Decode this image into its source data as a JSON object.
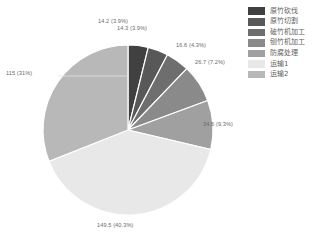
{
  "chart_data": {
    "type": "pie",
    "title": "",
    "subtitle": "",
    "xlabel": "",
    "ylabel": "",
    "legend_position": "top-right",
    "grid": false,
    "start_angle_deg": 0,
    "direction": "clockwise",
    "total": 370.9,
    "categories": [
      "原竹砍伐",
      "原竹切割",
      "破竹机加工",
      "刨竹机加工",
      "防腐处理",
      "运输1",
      "运输2"
    ],
    "values": [
      14.2,
      14.3,
      16.6,
      26.7,
      34.6,
      149.5,
      115
    ],
    "percents": [
      3.9,
      3.9,
      4.3,
      7.2,
      9.3,
      40.3,
      31
    ],
    "colors": [
      "#404040",
      "#585858",
      "#6e6e6e",
      "#8a8a8a",
      "#a0a0a0",
      "#e8e8e8",
      "#b8b8b8"
    ],
    "slice_border_color": "#ffffff",
    "data_labels": [
      "14.2 (3.9%)",
      "14.3 (3.9%)",
      "16.6 (4.3%)",
      "26.7 (7.2%)",
      "34.6 (9.3%)",
      "149.5 (40.3%)",
      "115 (31%)"
    ]
  },
  "legend": {
    "items": [
      {
        "label": "原竹砍伐",
        "color": "#404040"
      },
      {
        "label": "原竹切割",
        "color": "#585858"
      },
      {
        "label": "破竹机加工",
        "color": "#6e6e6e"
      },
      {
        "label": "刨竹机加工",
        "color": "#8a8a8a"
      },
      {
        "label": "防腐处理",
        "color": "#a0a0a0"
      },
      {
        "label": "运输1",
        "color": "#e8e8e8"
      },
      {
        "label": "运输2",
        "color": "#b8b8b8"
      }
    ]
  },
  "labels": {
    "slice_0": "14.2 (3.9%)",
    "slice_1": "14.3 (3.9%)",
    "slice_2": "16.6 (4.3%)",
    "slice_3": "26.7 (7.2%)",
    "slice_4": "34.6 (9.3%)",
    "slice_5": "149.5 (40.3%)",
    "slice_6": "115 (31%)"
  }
}
